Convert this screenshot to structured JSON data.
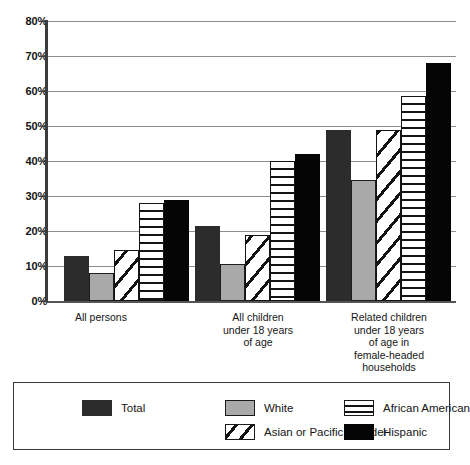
{
  "chart_data": {
    "type": "bar",
    "title": "",
    "subtitle": "",
    "xlabel": "",
    "ylabel": "",
    "ylim": [
      0,
      80
    ],
    "ytick_labels": [
      "0%",
      "10%",
      "20%",
      "30%",
      "40%",
      "50%",
      "60%",
      "70%",
      "80%"
    ],
    "ytick_values": [
      0,
      10,
      20,
      30,
      40,
      50,
      60,
      70,
      80
    ],
    "grid": true,
    "legend_position": "bottom",
    "categories": [
      "All persons",
      "All children under 18 years of age",
      "Related children under 18 years of age in female-headed households"
    ],
    "series": [
      {
        "name": "Total",
        "values": [
          13,
          21.5,
          49
        ],
        "color": "#2c2c2c",
        "pattern": "solid"
      },
      {
        "name": "White",
        "values": [
          8,
          10.5,
          34.5
        ],
        "color": "#a9a9a9",
        "pattern": "solid"
      },
      {
        "name": "Asian or Pacific Islander",
        "values": [
          14.5,
          19,
          49
        ],
        "color": "#ffffff",
        "pattern": "diagonal-hatch"
      },
      {
        "name": "African American",
        "values": [
          28,
          40,
          58.5
        ],
        "color": "#ffffff",
        "pattern": "horizontal-stripes"
      },
      {
        "name": "Hispanic",
        "values": [
          29,
          42,
          68
        ],
        "color": "#050505",
        "pattern": "solid"
      }
    ]
  },
  "axis": {
    "ytick_labels": [
      "80%",
      "70%",
      "60%",
      "50%",
      "40%",
      "30%",
      "20%",
      "10%",
      "0%"
    ]
  },
  "category_labels": [
    {
      "lines": [
        "All persons"
      ]
    },
    {
      "lines": [
        "All children",
        "under 18 years",
        "of age"
      ]
    },
    {
      "lines": [
        "Related children",
        "under 18 years",
        "of age in",
        "female-headed",
        "households"
      ]
    }
  ],
  "legend": {
    "items": [
      {
        "label": "Total",
        "swatch": "total"
      },
      {
        "label": "White",
        "swatch": "white"
      },
      {
        "label": "Asian or Pacific Islander",
        "swatch": "asian"
      },
      {
        "label": "African American",
        "swatch": "african"
      },
      {
        "label": "Hispanic",
        "swatch": "hispanic"
      }
    ]
  }
}
